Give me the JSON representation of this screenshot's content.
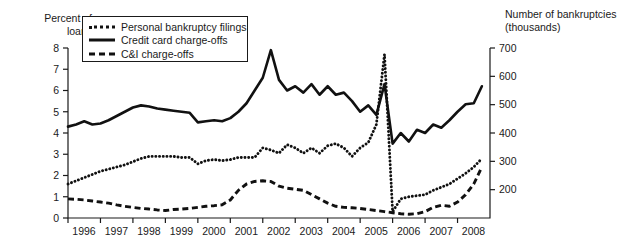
{
  "left_axis": {
    "title": "Percent of\nloans",
    "ticks": [
      "0",
      "1",
      "2",
      "3",
      "4",
      "5",
      "6",
      "7",
      "8"
    ]
  },
  "right_axis": {
    "title": "Number of bankruptcies\n(thousands)",
    "ticks": [
      "200",
      "300",
      "400",
      "500",
      "600",
      "700"
    ]
  },
  "legend": {
    "items": [
      {
        "label": "Personal bankruptcy filings",
        "style": "dotted"
      },
      {
        "label": "Credit card charge-offs",
        "style": "solid"
      },
      {
        "label": "C&I charge-offs",
        "style": "dashed"
      }
    ]
  },
  "x_axis": {
    "ticks": [
      "1996",
      "1997",
      "1998",
      "1999",
      "2000",
      "2001",
      "2002",
      "2003",
      "2004",
      "2005",
      "2006",
      "2007",
      "2008"
    ]
  },
  "chart_data": {
    "type": "line",
    "title": "",
    "xlabel": "",
    "ylabel": "Percent of loans",
    "y2label": "Number of bankruptcies (thousands)",
    "grid": false,
    "legend_position": "top-left",
    "xlim": [
      1996.0,
      2009.0
    ],
    "ylim": [
      0,
      8
    ],
    "y2lim": [
      100,
      700
    ],
    "y2_mapping_note": "right axis 200..700 aligns with left axis 1.9..8.0; value_right = 100 + left*75",
    "x": [
      1996.0,
      1996.25,
      1996.5,
      1996.75,
      1997.0,
      1997.25,
      1997.5,
      1997.75,
      1998.0,
      1998.25,
      1998.5,
      1998.75,
      1999.0,
      1999.25,
      1999.5,
      1999.75,
      2000.0,
      2000.25,
      2000.5,
      2000.75,
      2001.0,
      2001.25,
      2001.5,
      2001.75,
      2002.0,
      2002.25,
      2002.5,
      2002.75,
      2003.0,
      2003.25,
      2003.5,
      2003.75,
      2004.0,
      2004.25,
      2004.5,
      2004.75,
      2005.0,
      2005.25,
      2005.5,
      2005.75,
      2006.0,
      2006.25,
      2006.5,
      2006.75,
      2007.0,
      2007.25,
      2007.5,
      2007.75,
      2008.0,
      2008.25,
      2008.5,
      2008.75
    ],
    "series": [
      {
        "name": "Credit card charge-offs",
        "style": "solid",
        "axis": "left",
        "unit": "percent of loans",
        "values": [
          4.3,
          4.4,
          4.55,
          4.4,
          4.45,
          4.6,
          4.8,
          5.0,
          5.2,
          5.3,
          5.25,
          5.15,
          5.1,
          5.05,
          5.0,
          4.95,
          4.5,
          4.55,
          4.6,
          4.55,
          4.7,
          5.0,
          5.4,
          6.0,
          6.6,
          7.9,
          6.5,
          6.0,
          6.2,
          5.9,
          6.3,
          5.8,
          6.2,
          5.8,
          5.9,
          5.5,
          5.0,
          5.3,
          4.85,
          6.3,
          3.5,
          4.0,
          3.6,
          4.15,
          4.0,
          4.4,
          4.25,
          4.6,
          5.0,
          5.35,
          5.4,
          6.2
        ]
      },
      {
        "name": "Personal bankruptcy filings",
        "style": "dotted",
        "axis": "right",
        "unit": "thousands of bankruptcies",
        "values_percent_scale": [
          1.6,
          1.75,
          1.9,
          2.05,
          2.2,
          2.3,
          2.4,
          2.5,
          2.65,
          2.8,
          2.9,
          2.9,
          2.9,
          2.9,
          2.85,
          2.85,
          2.55,
          2.7,
          2.75,
          2.7,
          2.75,
          2.85,
          2.85,
          2.85,
          3.3,
          3.2,
          3.05,
          3.45,
          3.3,
          3.05,
          3.3,
          3.05,
          3.4,
          3.5,
          3.3,
          2.9,
          3.3,
          3.55,
          4.4,
          7.7,
          0.3,
          0.9,
          1.0,
          1.05,
          1.1,
          1.3,
          1.45,
          1.6,
          1.85,
          2.1,
          2.4,
          2.8
        ],
        "values_thousands": [
          220,
          231,
          243,
          254,
          265,
          273,
          280,
          288,
          299,
          310,
          318,
          318,
          318,
          318,
          314,
          314,
          291,
          303,
          306,
          303,
          306,
          314,
          314,
          314,
          348,
          340,
          329,
          359,
          348,
          329,
          348,
          329,
          355,
          363,
          348,
          318,
          348,
          366,
          430,
          678,
          123,
          168,
          175,
          179,
          183,
          198,
          209,
          220,
          239,
          258,
          280,
          310
        ]
      },
      {
        "name": "C&I charge-offs",
        "style": "dashed",
        "axis": "left",
        "unit": "percent of loans",
        "values": [
          0.9,
          0.88,
          0.85,
          0.8,
          0.75,
          0.7,
          0.62,
          0.55,
          0.5,
          0.45,
          0.42,
          0.38,
          0.35,
          0.4,
          0.42,
          0.45,
          0.5,
          0.55,
          0.58,
          0.62,
          0.85,
          1.3,
          1.6,
          1.72,
          1.75,
          1.72,
          1.5,
          1.4,
          1.35,
          1.3,
          1.1,
          0.9,
          0.7,
          0.55,
          0.5,
          0.48,
          0.45,
          0.4,
          0.35,
          0.3,
          0.25,
          0.2,
          0.18,
          0.2,
          0.3,
          0.5,
          0.6,
          0.55,
          0.75,
          1.1,
          1.6,
          2.4
        ]
      }
    ]
  }
}
